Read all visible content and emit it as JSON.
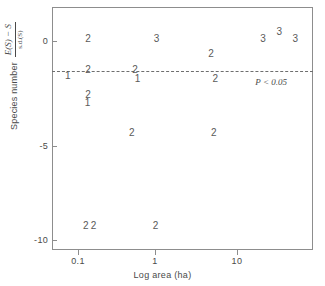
{
  "chart_data": {
    "type": "scatter",
    "title": "",
    "xlabel": "Log area (ha)",
    "ylabel": "Species number",
    "ylabel_numerator": "E(S) − S",
    "ylabel_denominator": "s.d.(S)",
    "xscale": "log",
    "xlim": [
      0.07,
      60
    ],
    "ylim": [
      -11.2,
      1.6
    ],
    "grid": false,
    "legend": null,
    "xticks": [
      0.1,
      1,
      10
    ],
    "xtick_labels": [
      "0.1",
      "1",
      "10"
    ],
    "yticks": [
      0,
      -5,
      -10
    ],
    "ytick_labels": [
      "0",
      "-5",
      "-10"
    ],
    "marker_style": "digit-count",
    "marker_note": "Each plotted digit is the number of overlapping observations at that location",
    "annotations": [
      {
        "name": "significance-threshold",
        "text": "P < 0.05",
        "type": "hline",
        "y": -1.75,
        "linestyle": "dashed",
        "label_x": 13.5,
        "label_y": -2.35
      }
    ],
    "points": [
      {
        "label": "1",
        "x": 0.105,
        "y": -2.05
      },
      {
        "label": "2",
        "x": 0.178,
        "y": -0.1
      },
      {
        "label": "2",
        "x": 0.178,
        "y": -1.7
      },
      {
        "label": "2",
        "x": 0.178,
        "y": -3.05
      },
      {
        "label": "1",
        "x": 0.175,
        "y": -3.45
      },
      {
        "label": "2",
        "x": 0.6,
        "y": -1.7
      },
      {
        "label": "1",
        "x": 0.64,
        "y": -2.2
      },
      {
        "label": "3",
        "x": 1.05,
        "y": -0.1
      },
      {
        "label": "2",
        "x": 4.3,
        "y": -0.85
      },
      {
        "label": "2",
        "x": 4.8,
        "y": -2.2
      },
      {
        "label": "3",
        "x": 16.5,
        "y": -0.1
      },
      {
        "label": "3",
        "x": 25.0,
        "y": 0.3
      },
      {
        "label": "3",
        "x": 38.0,
        "y": -0.1
      },
      {
        "label": "2",
        "x": 0.55,
        "y": -5.05
      },
      {
        "label": "2",
        "x": 4.6,
        "y": -5.05
      },
      {
        "label": "2",
        "x": 0.168,
        "y": -9.95
      },
      {
        "label": "2",
        "x": 0.205,
        "y": -9.95
      },
      {
        "label": "2",
        "x": 1.02,
        "y": -9.95
      }
    ]
  },
  "axes": {
    "x_title": "Log area (ha)",
    "y_title": "Species number",
    "y_numerator": "E(S) − S",
    "y_denominator": "s.d.(S)",
    "x_ticks": [
      {
        "label": "0.1",
        "px": 78
      },
      {
        "label": "1",
        "px": 155
      },
      {
        "label": "10",
        "px": 237
      }
    ],
    "y_ticks": [
      {
        "label": "0",
        "px": 41
      },
      {
        "label": "-5",
        "px": 146
      },
      {
        "label": "-10",
        "px": 240
      }
    ]
  },
  "threshold": {
    "label": "P < 0.05",
    "y_px": 78
  },
  "style": {
    "axis_color": "#8d8d8d",
    "text_color": "#4a4a4a",
    "marker_color": "#5a5a5a",
    "background": "#ffffff"
  }
}
